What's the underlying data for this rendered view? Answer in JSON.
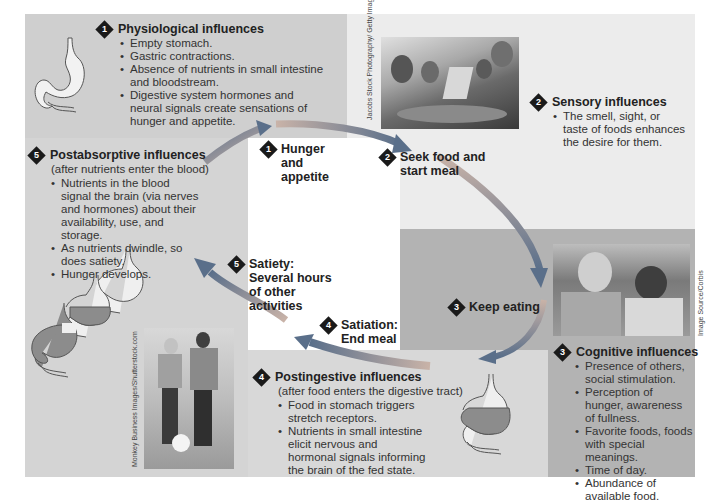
{
  "colors": {
    "panel_dark": "#b3b3b3",
    "panel_mid": "#cfcfcf",
    "panel_light": "#ececec",
    "arrow_start": "#c9b3a8",
    "arrow_end": "#5a6f8a",
    "stomach_fill": "#8c8c8c",
    "diamond": "#1a1a1a"
  },
  "physiological": {
    "number": "1",
    "title": "Physiological influences",
    "bullets": [
      "Empty stomach.",
      "Gastric contractions.",
      "Absence of nutrients in small intestine and bloodstream.",
      "Digestive system hormones and neural signals create sensations of hunger and appetite."
    ]
  },
  "sensory": {
    "number": "2",
    "title": "Sensory influences",
    "bullets": [
      "The smell, sight, or taste of foods enhances the desire for them."
    ],
    "photo_credit": "Jacobs Stock Photography/ Getty Images"
  },
  "cognitive": {
    "number": "3",
    "title": "Cognitive influences",
    "bullets": [
      "Presence of others, social stimulation.",
      "Perception of hunger, awareness of fullness.",
      "Favorite foods, foods with special meanings.",
      "Time of day.",
      "Abundance of available food."
    ],
    "photo_credit": "Image Source/Corbis"
  },
  "postingestive": {
    "number": "4",
    "title": "Postingestive influences",
    "subtitle": "(after food enters the digestive tract)",
    "bullets": [
      "Food in stomach triggers stretch receptors.",
      "Nutrients in small intestine elicit nervous and hormonal signals informing the brain of the fed state."
    ]
  },
  "postabsorptive": {
    "number": "5",
    "title": "Postabsorptive influences",
    "subtitle": "(after nutrients enter the blood)",
    "bullets": [
      "Nutrients in the blood signal the brain (via nerves and hormones) about their availability, use, and storage.",
      "As nutrients dwindle, so does satiety.",
      "Hunger develops."
    ],
    "photo_credit": "Monkey Business Images/Shutterstock.com"
  },
  "cycle_steps": [
    {
      "number": "1",
      "label": "Hunger and appetite"
    },
    {
      "number": "2",
      "label": "Seek food and start meal"
    },
    {
      "number": "3",
      "label": "Keep eating"
    },
    {
      "number": "4",
      "label": "Satiation: End meal"
    },
    {
      "number": "5",
      "label": "Satiety: Several hours of other activities"
    }
  ]
}
